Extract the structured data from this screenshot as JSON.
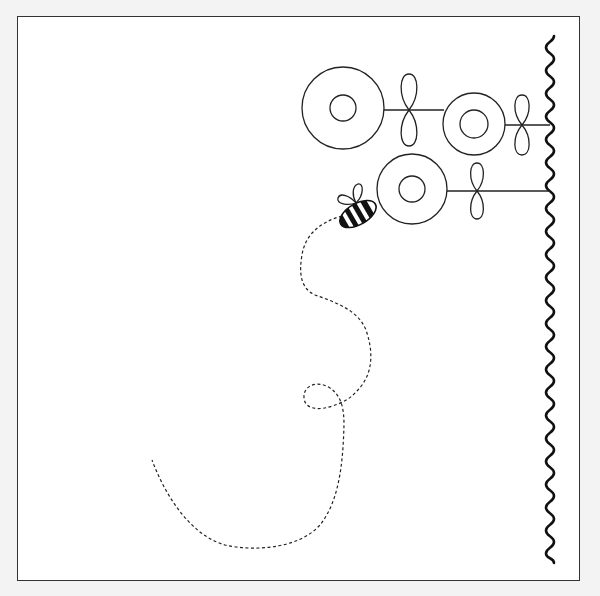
{
  "illustration": {
    "subject": "bee flying among flowers",
    "colors": {
      "background": "#f3f3f3",
      "paper": "#ffffff",
      "ink": "#111111",
      "frame": "#333333"
    },
    "flowers": [
      {
        "cx": 343,
        "cy": 108,
        "outer_r": 41,
        "inner_r": 13
      },
      {
        "cx": 474,
        "cy": 124,
        "outer_r": 31,
        "inner_r": 14
      },
      {
        "cx": 412,
        "cy": 189,
        "outer_r": 35,
        "inner_r": 13
      }
    ],
    "leaves": [
      {
        "cx": 409,
        "cy": 110,
        "half_h": 36,
        "w": 10
      },
      {
        "cx": 522,
        "cy": 125,
        "half_h": 30,
        "w": 9
      },
      {
        "cx": 477,
        "cy": 191,
        "half_h": 28,
        "w": 9
      }
    ],
    "stems": [
      {
        "x1": 384,
        "y1": 110,
        "x2": 444,
        "y2": 110
      },
      {
        "x1": 505,
        "y1": 125,
        "x2": 550,
        "y2": 125
      },
      {
        "x1": 447,
        "y1": 191,
        "x2": 550,
        "y2": 191
      }
    ],
    "bee": {
      "cx": 358,
      "cy": 214,
      "rx": 20,
      "ry": 11,
      "rotation": -30
    },
    "wavy_line": {
      "x": 550,
      "y_start": 36,
      "y_end": 563,
      "amplitude": 4,
      "period": 23
    }
  }
}
